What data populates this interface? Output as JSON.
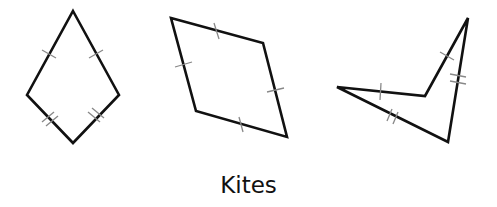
{
  "caption": "Kites",
  "colors": {
    "outline": "#111111",
    "tick": "#888888",
    "background": "#ffffff"
  },
  "figures": [
    {
      "name": "convex-kite",
      "vertices": [
        [
          73,
          11
        ],
        [
          119,
          95
        ],
        [
          73,
          143
        ],
        [
          27,
          95
        ]
      ],
      "tick_marks": [
        "top-left side: single",
        "top-right side: single",
        "bottom-left side: double",
        "bottom-right side: double"
      ]
    },
    {
      "name": "rhombus-kite",
      "vertices": [
        [
          171,
          18
        ],
        [
          263,
          43
        ],
        [
          287,
          137
        ],
        [
          196,
          111
        ]
      ],
      "tick_marks": [
        "all four sides: single"
      ]
    },
    {
      "name": "concave-kite-dart",
      "vertices": [
        [
          337,
          87
        ],
        [
          425,
          96
        ],
        [
          468,
          18
        ],
        [
          448,
          142
        ]
      ],
      "tick_marks": [
        "left-upper side: single",
        "inner-right side: single",
        "right side: double",
        "left-lower side: double"
      ]
    }
  ]
}
